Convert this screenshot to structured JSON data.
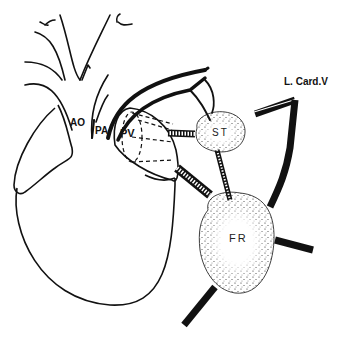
{
  "diagram": {
    "type": "anatomical-line-drawing",
    "colors": {
      "stroke": "#111111",
      "background": "#ffffff",
      "stipple": "#222222"
    },
    "labels": {
      "aorta": "AO",
      "pulmonary_artery": "PA",
      "pulmonary_vein": "PV",
      "st_node": "ST",
      "fr_node": "FR",
      "left_cardiac_vein": "L. Card.V"
    }
  }
}
